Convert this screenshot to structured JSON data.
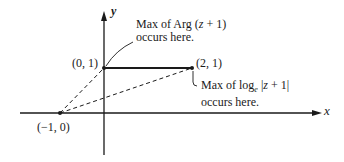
{
  "axes": {
    "x_label": "x",
    "y_label": "y"
  },
  "points": [
    {
      "id": "p_0_1",
      "label": "(0, 1)",
      "coords": [
        0,
        1
      ]
    },
    {
      "id": "p_2_1",
      "label": "(2, 1)",
      "coords": [
        2,
        1
      ]
    },
    {
      "id": "p_m1_0",
      "label": "(−1, 0)",
      "coords": [
        -1,
        0
      ]
    }
  ],
  "annotations": {
    "arg": {
      "line1": "Max of Arg (",
      "var": "z",
      "line1_end": " + 1)",
      "line2": "occurs here."
    },
    "log": {
      "line1": "Max of log",
      "sub": "e",
      "mid": " |",
      "var": "z",
      "line1_end": " + 1|",
      "line2": "occurs here."
    }
  },
  "colors": {
    "ink": "#1a1a1a",
    "background": "#ffffff"
  }
}
